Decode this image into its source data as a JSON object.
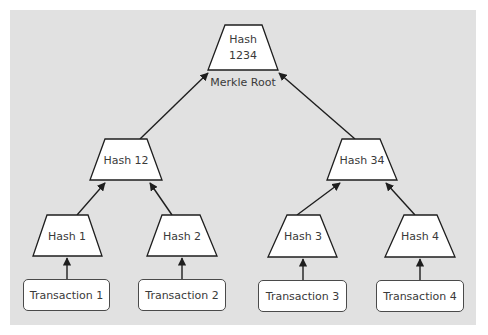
{
  "diagram": {
    "background_color": "#e1e1e1",
    "node_fill": "#ffffff",
    "stroke_color": "#2a2a2a",
    "root": {
      "label_line1": "Hash",
      "label_line2": "1234",
      "caption": "Merkle Root"
    },
    "level1": [
      {
        "label": "Hash 12"
      },
      {
        "label": "Hash 34"
      }
    ],
    "level2": [
      {
        "label": "Hash 1"
      },
      {
        "label": "Hash 2"
      },
      {
        "label": "Hash 3"
      },
      {
        "label": "Hash 4"
      }
    ],
    "transactions": [
      {
        "label": "Transaction 1"
      },
      {
        "label": "Transaction 2"
      },
      {
        "label": "Transaction 3"
      },
      {
        "label": "Transaction 4"
      }
    ],
    "edges": [
      {
        "from": "Transaction 1",
        "to": "Hash 1"
      },
      {
        "from": "Transaction 2",
        "to": "Hash 2"
      },
      {
        "from": "Transaction 3",
        "to": "Hash 3"
      },
      {
        "from": "Transaction 4",
        "to": "Hash 4"
      },
      {
        "from": "Hash 1",
        "to": "Hash 12"
      },
      {
        "from": "Hash 2",
        "to": "Hash 12"
      },
      {
        "from": "Hash 3",
        "to": "Hash 34"
      },
      {
        "from": "Hash 4",
        "to": "Hash 34"
      },
      {
        "from": "Hash 12",
        "to": "Hash 1234"
      },
      {
        "from": "Hash 34",
        "to": "Hash 1234"
      }
    ]
  }
}
